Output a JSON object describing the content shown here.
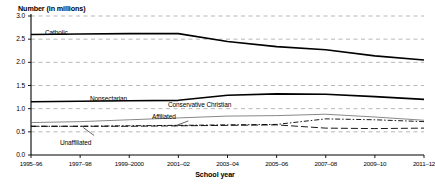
{
  "chart_data": {
    "type": "line",
    "title": "",
    "ylabel": "Number (in millions)",
    "xlabel": "School year",
    "categories": [
      "1995–96",
      "1997–98",
      "1999–2000",
      "2001–02",
      "2003–04",
      "2005–06",
      "2007–08",
      "2009–10",
      "2011–12"
    ],
    "ytick_labels": [
      "0.0",
      "0.5",
      "1.0",
      "1.5",
      "2.0",
      "2.5",
      "3.0"
    ],
    "ytick_values": [
      0.0,
      0.5,
      1.0,
      1.5,
      2.0,
      2.5,
      3.0
    ],
    "ylim": [
      0.0,
      3.0
    ],
    "grid": true,
    "grid_style": "dashed-horizontal",
    "legend_position": "inline-annotations",
    "series": [
      {
        "name": "Catholic",
        "style": "solid",
        "width": 1.6,
        "color": "#000000",
        "values": [
          2.6,
          2.61,
          2.62,
          2.62,
          2.45,
          2.34,
          2.27,
          2.14,
          2.05
        ],
        "label_x": "1997–98",
        "label_y": 2.82
      },
      {
        "name": "Nonsectarian",
        "style": "solid",
        "width": 1.6,
        "color": "#000000",
        "values": [
          1.15,
          1.16,
          1.17,
          1.18,
          1.29,
          1.32,
          1.31,
          1.26,
          1.2
        ],
        "label_x": "1999–2000",
        "label_y": 1.34
      },
      {
        "name": "Conservative Christian",
        "style": "solid",
        "width": 0.7,
        "color": "#555555",
        "values": [
          0.7,
          0.72,
          0.76,
          0.8,
          0.84,
          0.85,
          0.88,
          0.82,
          0.75
        ],
        "label_x": "2003–04",
        "label_y": 1.02
      },
      {
        "name": "Affiliated",
        "style": "dash-dot",
        "width": 0.9,
        "color": "#000000",
        "values": [
          0.62,
          0.62,
          0.63,
          0.64,
          0.65,
          0.66,
          0.78,
          0.76,
          0.72
        ],
        "label_x": "2002–03",
        "label_y": 0.8
      },
      {
        "name": "Unaffiliated",
        "style": "long-dash",
        "width": 0.9,
        "color": "#000000",
        "values": [
          0.62,
          0.62,
          0.62,
          0.63,
          0.64,
          0.65,
          0.58,
          0.57,
          0.58
        ],
        "label_x": "1998–99",
        "label_y": 0.37
      }
    ]
  }
}
